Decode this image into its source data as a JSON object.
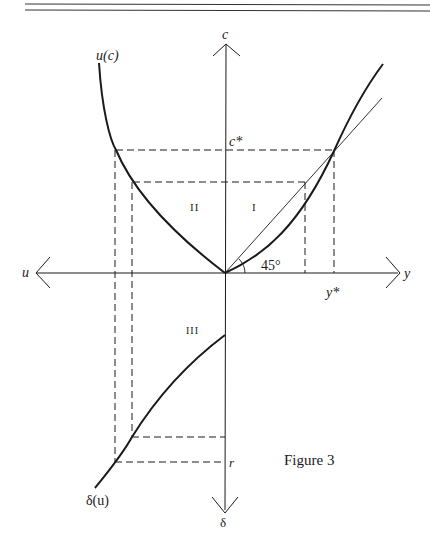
{
  "figure": {
    "caption": "Figure 3",
    "colors": {
      "ink": "#1a1a1a",
      "background": "#ffffff"
    }
  },
  "axes": {
    "up": "c",
    "right": "y",
    "left": "u",
    "down": "δ"
  },
  "curves": {
    "utility": "u(c)",
    "discount": "δ(u)"
  },
  "markers": {
    "c_star": "c*",
    "y_star": "y*",
    "r": "r",
    "angle": "45°"
  },
  "quadrants": {
    "q1": "I",
    "q2": "II",
    "q3": "III"
  }
}
